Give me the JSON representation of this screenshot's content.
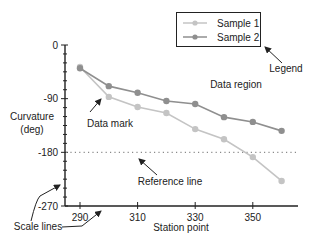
{
  "chart_data": {
    "type": "line",
    "title": "",
    "xlabel": "Station point",
    "ylabel": [
      "Curvature",
      "(deg)"
    ],
    "x": [
      290,
      300,
      310,
      320,
      330,
      340,
      350,
      360
    ],
    "xticks": [
      290,
      310,
      330,
      350
    ],
    "yticks": [
      0,
      -90,
      -180,
      -270
    ],
    "xlim": [
      283,
      369
    ],
    "ylim": [
      -270,
      0
    ],
    "grid": false,
    "legend_position": "top-right",
    "series": [
      {
        "name": "Sample 1",
        "color": "#c4c4c4",
        "values": [
          -37,
          -87,
          -104,
          -114,
          -141,
          -158,
          -188,
          -228
        ]
      },
      {
        "name": "Sample 2",
        "color": "#8f8f8f",
        "values": [
          -39,
          -69,
          -80,
          -94,
          -99,
          -121,
          -129,
          -144
        ]
      }
    ],
    "reference_line": {
      "value": -180,
      "style": "dotted"
    },
    "annotations": [
      {
        "text": "Legend"
      },
      {
        "text": "Data region"
      },
      {
        "text": "Data mark"
      },
      {
        "text": "Reference line"
      },
      {
        "text": "Scale lines"
      }
    ]
  }
}
